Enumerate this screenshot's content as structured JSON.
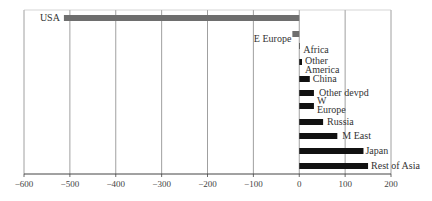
{
  "chart_data": {
    "type": "bar",
    "orientation": "horizontal",
    "title": "",
    "xlabel": "",
    "ylabel": "",
    "xlim": [
      -600,
      200
    ],
    "xticks": [
      -600,
      -500,
      -400,
      -300,
      -200,
      -100,
      0,
      100,
      200
    ],
    "xtick_labels": [
      "−600",
      "−500",
      "−400",
      "−300",
      "−200",
      "−100",
      "0",
      "100",
      "200"
    ],
    "grid": "vertical",
    "legend": null,
    "categories": [
      "USA",
      "E Europe",
      "Africa",
      "Other America",
      "China",
      "Other devpd",
      "W Europe",
      "Russia",
      "M East",
      "Japan",
      "Rest of Asia"
    ],
    "values": [
      -513,
      -15,
      1,
      6,
      23,
      32,
      32,
      52,
      83,
      140,
      150
    ],
    "colors": {
      "negative": "#6e6e6e",
      "positive": "#111111",
      "grid": "#888888",
      "axis": "#444444"
    }
  }
}
